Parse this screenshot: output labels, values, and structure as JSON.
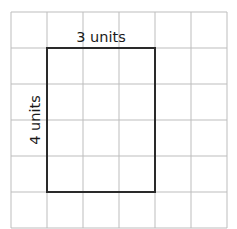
{
  "diagram": {
    "type": "grid-rectangle",
    "grid": {
      "columns": 6,
      "rows": 6,
      "x0": 11,
      "y0": 12,
      "cell": 36,
      "line_color": "#bdbdbd"
    },
    "rectangle": {
      "col_start": 1,
      "row_start": 1,
      "width_units": 3,
      "height_units": 4,
      "stroke_color": "#2a2a2a"
    },
    "labels": {
      "top": "3 units",
      "left": "4 units"
    }
  }
}
